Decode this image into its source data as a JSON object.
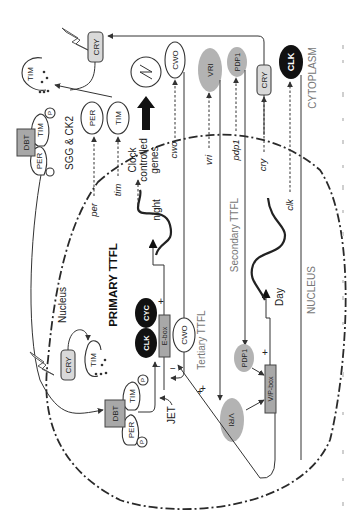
{
  "diagram": {
    "orientation": "rotated 90 degrees clockwise (landscape figure shown in portrait)",
    "compartments": {
      "nucleus_label": "NUCLEUS",
      "cytoplasm_label": "CYTOPLASM",
      "nucleus_inner_label": "Nucleus"
    },
    "loops": {
      "primary": "PRIMARY TTFL",
      "secondary": "Secondary TTFL",
      "tertiary": "Tertiary TTFL"
    },
    "proteins": {
      "clk": "CLK",
      "cyc": "CYC",
      "cwo": "CWO",
      "vri": "VRI",
      "pdp1": "PDP1",
      "cry": "CRY",
      "tim": "TIM",
      "per": "PER",
      "dbt": "DBT",
      "phospho": "P",
      "jet": "JET"
    },
    "promoters": {
      "ebox": "E-box",
      "vpbox": "V/P-box"
    },
    "genes": {
      "per": "per",
      "tim": "tim",
      "cwo": "cwo",
      "vri": "vri",
      "pdp1": "pdp1",
      "cry": "cry",
      "clk": "clk"
    },
    "phases": {
      "night": "night",
      "day": "Day"
    },
    "kinases": "SGG & CK2",
    "output": {
      "line1": "Clock",
      "line2": "controlled",
      "line3": "genes",
      "oscillation_symbol": "∿"
    },
    "signs": {
      "plus": "+",
      "minus": "−"
    }
  }
}
